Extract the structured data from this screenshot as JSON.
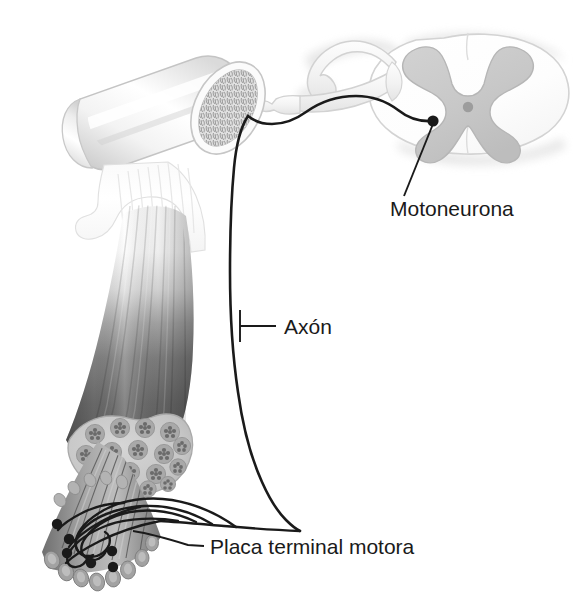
{
  "figure": {
    "background_color": "#ffffff",
    "line_color": "#1a1a1a",
    "text_color": "#1a1a1a",
    "width": 573,
    "height": 608
  },
  "labels": [
    {
      "id": "motoneurona",
      "text": "Motoneurona",
      "x": 390,
      "y": 216,
      "leader_from": [
        433,
        121
      ],
      "leader_to": [
        404,
        196
      ]
    },
    {
      "id": "axon",
      "text": "Axón",
      "x": 281,
      "y": 333,
      "leader_from": [
        240,
        326
      ],
      "leader_to": [
        272,
        326
      ]
    },
    {
      "id": "placa-terminal-motora",
      "text": "Placa terminal motora",
      "x": 210,
      "y": 553,
      "leader_from": [
        133,
        531
      ],
      "leader_to": [
        202,
        546
      ]
    }
  ],
  "structures": {
    "bone": {
      "name": "bone-with-trabecular-cross-section",
      "fill_light": "#ffffff",
      "fill_shade": "#d8d8d8",
      "outline": "#b8b8b8"
    },
    "tendon": {
      "name": "tendon-aponeurosis",
      "fill": "#f2f2f2"
    },
    "muscle_belly": {
      "name": "muscle-belly",
      "fill_top": "#ffffff",
      "fill_bottom": "#5a5a5a",
      "striation_color": "#6f6f6f"
    },
    "muscle_cross_section": {
      "name": "muscle-fascicle-cross-section",
      "perimysium_fill": "#c9c9c9",
      "fascicle_fill": "#a8a8a8",
      "fiber_dot_fill": "#6e6e6e",
      "fascicle_count": 17
    },
    "fiber_bundle": {
      "name": "muscle-fiber-bundle",
      "fiber_fill": "#909090",
      "fiber_count": 12
    },
    "spinal_cord": {
      "name": "spinal-cord-cross-section",
      "white_matter_fill": "#fbfbfb",
      "white_matter_outline": "#d5d5d5",
      "gray_matter_fill": "#cbcbcb",
      "gray_matter_outline": "#b5b5b5",
      "central_canal_fill": "#9a9a9a",
      "meninges_fill": "#e2e2e2"
    },
    "nerve_roots": {
      "name": "spinal-nerve-roots-and-ganglion",
      "fill": "#f0f0f0",
      "outline": "#d0d0d0"
    },
    "soma": {
      "name": "motoneuron-cell-body",
      "fill": "#1a1a1a",
      "cx": 433,
      "cy": 121,
      "r": 5.5
    },
    "end_plates": {
      "name": "motor-end-plates",
      "dot_fill": "#1a1a1a",
      "count": 6,
      "points": [
        [
          57,
          523
        ],
        [
          70,
          537
        ],
        [
          67,
          552
        ],
        [
          90,
          562
        ],
        [
          113,
          567
        ],
        [
          112,
          551
        ]
      ]
    }
  }
}
